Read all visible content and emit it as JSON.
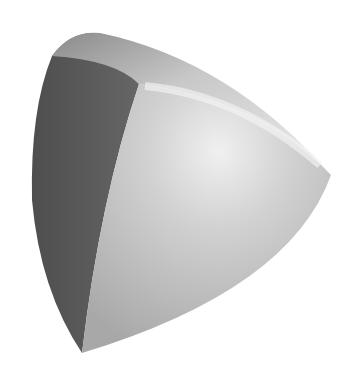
{
  "scene": {
    "subject": "Reuleaux tetrahedron (3D rendered solid)",
    "background": "#ffffff",
    "colors": {
      "dark_face": "#5a5a5a",
      "dark_face_edge": "#4a4a4a",
      "light_face": "#bcbcbc",
      "highlight": "#ededed",
      "top_face": "#cfcfcf"
    }
  }
}
